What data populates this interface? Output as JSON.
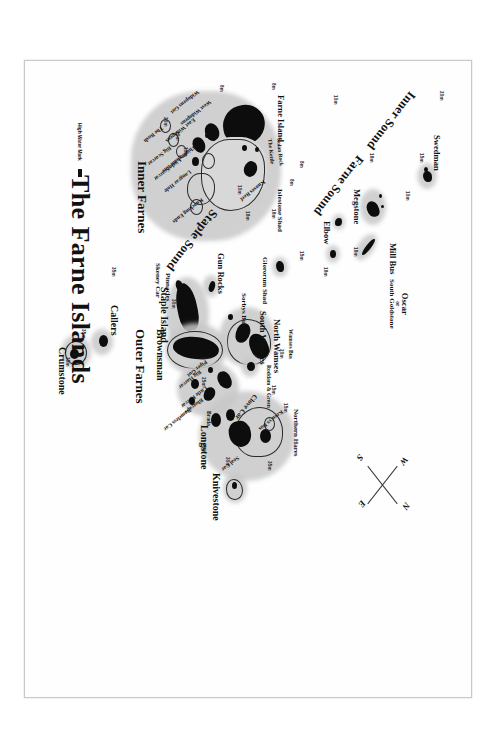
{
  "map": {
    "title": "The Farne Islands",
    "legend": {
      "label": "High Water Mark",
      "swatch_color": "#111111"
    },
    "compass": {
      "north": "N",
      "south": "S",
      "east": "E",
      "west": "W"
    },
    "groups": [
      {
        "name": "Inner Farnes"
      },
      {
        "name": "Outer Farnes"
      }
    ],
    "sounds": [
      {
        "name": "Inner Sound"
      },
      {
        "name": "Farne Sound"
      },
      {
        "name": "Staple Sound"
      }
    ],
    "islands": [
      {
        "name": "Swedman"
      },
      {
        "name": "Megstone"
      },
      {
        "name": "Elbow"
      },
      {
        "name": "Mill Bus"
      },
      {
        "name": "Oscar",
        "alt_prefix": "or",
        "alt": "South Goldstone"
      },
      {
        "name": "Glororum Shad"
      },
      {
        "name": "Islestone Shad"
      },
      {
        "name": "Wamses Bus"
      },
      {
        "name": "North Wamses"
      },
      {
        "name": "South Wamses"
      },
      {
        "name": "Sorbys Bus"
      },
      {
        "name": "Gun Rocks"
      },
      {
        "name": "Staple Island"
      },
      {
        "name": "Brownsman"
      },
      {
        "name": "Pinnacles"
      },
      {
        "name": "Skeney Car"
      },
      {
        "name": "Farne Island"
      },
      {
        "name": "Solan Rock"
      },
      {
        "name": "The Kettle"
      },
      {
        "name": "Knoxes Reef"
      },
      {
        "name": "West Widopens"
      },
      {
        "name": "Widopens Gut"
      },
      {
        "name": "East Widopens"
      },
      {
        "name": "Whittingham Bus"
      },
      {
        "name": "Little Scarcar"
      },
      {
        "name": "Big Scarcar"
      },
      {
        "name": "The Bush"
      },
      {
        "name": "Longcar Hole"
      },
      {
        "name": "Knocking Ends"
      },
      {
        "name": "Roddam & Green"
      },
      {
        "name": "Piper Gut"
      },
      {
        "name": "Big Harcar"
      },
      {
        "name": "Little Harcar"
      },
      {
        "name": "Bluecaps"
      },
      {
        "name": "Nameless Car"
      },
      {
        "name": "Clove Car"
      },
      {
        "name": "Keen'ys Bus"
      },
      {
        "name": "Northern Hares"
      },
      {
        "name": "Seal Car"
      },
      {
        "name": "Brada"
      },
      {
        "name": "Longstone"
      },
      {
        "name": "Knivestone"
      },
      {
        "name": "Callers"
      },
      {
        "name": "Crumstone"
      }
    ],
    "depths": [
      {
        "value": "20m"
      },
      {
        "value": "15m"
      },
      {
        "value": "10m"
      },
      {
        "value": "18m"
      },
      {
        "value": "18m"
      },
      {
        "value": "8m"
      },
      {
        "value": "10m"
      },
      {
        "value": "8m"
      },
      {
        "value": "8m"
      },
      {
        "value": "18m"
      },
      {
        "value": "15m"
      },
      {
        "value": "18m"
      },
      {
        "value": "10m"
      },
      {
        "value": "10m"
      },
      {
        "value": "20m"
      },
      {
        "value": "10m"
      },
      {
        "value": "18m"
      },
      {
        "value": "20m"
      },
      {
        "value": "15m"
      },
      {
        "value": "15m"
      },
      {
        "value": "25m"
      },
      {
        "value": "35m"
      },
      {
        "value": "30m"
      },
      {
        "value": "40m"
      },
      {
        "value": "30m"
      },
      {
        "value": "35m"
      },
      {
        "value": "35m"
      },
      {
        "value": "35m"
      },
      {
        "value": "8m"
      }
    ]
  }
}
